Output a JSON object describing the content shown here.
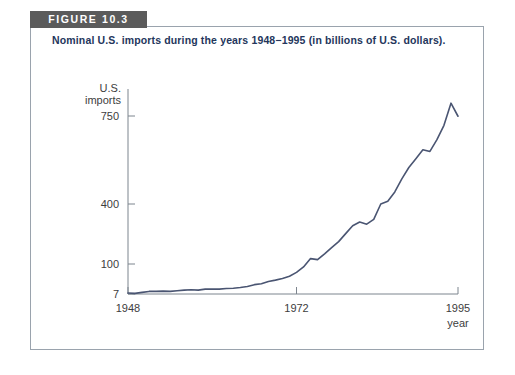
{
  "figure": {
    "badge_label": "FIGURE 10.3",
    "title": "Nominal U.S. imports during the years 1948−1995 (in billions of U.S. dollars).",
    "badge_bg": "#5b5b5b",
    "badge_color": "#ffffff",
    "title_color": "#24365c",
    "frame_color": "#9aa3ad"
  },
  "chart_data": {
    "type": "line",
    "title": "Nominal U.S. imports during the years 1948−1995 (in billions of U.S. dollars).",
    "xlabel": "year",
    "ylabel": "U.S. imports",
    "ylabel_line1": "U.S.",
    "ylabel_line2": "imports",
    "xlim": [
      1948,
      1995
    ],
    "ylim": [
      7,
      750
    ],
    "grid": false,
    "legend": null,
    "line_color": "#4a5572",
    "axis_color": "#7d858e",
    "xticks": [
      1948,
      1972,
      1995
    ],
    "xtick_labels": [
      "1948",
      "1972",
      "1995"
    ],
    "yticks": [
      7,
      100,
      400,
      750
    ],
    "ytick_labels": [
      "7",
      "100",
      "400",
      "750"
    ],
    "series": [
      {
        "name": "U.S. imports",
        "x": [
          1948,
          1949,
          1950,
          1951,
          1952,
          1953,
          1954,
          1955,
          1956,
          1957,
          1958,
          1959,
          1960,
          1961,
          1962,
          1963,
          1964,
          1965,
          1966,
          1967,
          1968,
          1969,
          1970,
          1971,
          1972,
          1973,
          1974,
          1975,
          1976,
          1977,
          1978,
          1979,
          1980,
          1981,
          1982,
          1983,
          1984,
          1985,
          1986,
          1987,
          1988,
          1989,
          1990,
          1991,
          1992,
          1993,
          1994,
          1995
        ],
        "values": [
          10,
          9,
          12,
          15,
          15,
          16,
          15,
          17,
          19,
          20,
          19,
          22,
          22,
          22,
          24,
          25,
          27,
          30,
          36,
          39,
          46,
          50,
          55,
          62,
          74,
          91,
          127,
          122,
          151,
          182,
          212,
          252,
          291,
          310,
          299,
          323,
          400,
          411,
          448,
          500,
          545,
          580,
          616,
          609,
          656,
          713,
          801,
          749
        ]
      }
    ]
  }
}
